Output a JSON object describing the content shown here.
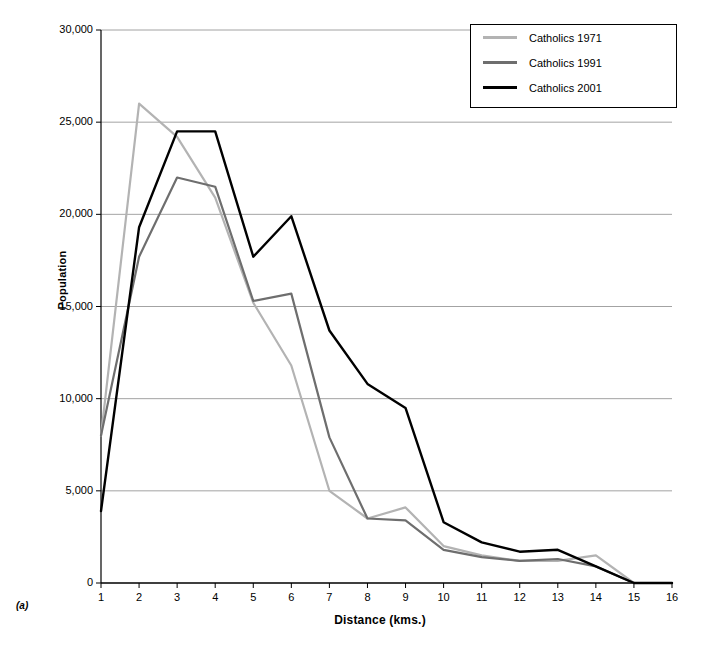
{
  "panel_label": "(a)",
  "legend": {
    "entries": [
      {
        "label": "Catholics 1971",
        "color": "#b3b3b3"
      },
      {
        "label": "Catholics 1991",
        "color": "#6e6e6e"
      },
      {
        "label": "Catholics 2001",
        "color": "#000000"
      }
    ]
  },
  "axes": {
    "y_ticks": [
      "0",
      "5,000",
      "10,000",
      "15,000",
      "20,000",
      "25,000",
      "30,000"
    ],
    "x_ticks": [
      "1",
      "2",
      "3",
      "4",
      "5",
      "6",
      "7",
      "8",
      "9",
      "10",
      "11",
      "12",
      "13",
      "14",
      "15",
      "16"
    ]
  },
  "chart_data": {
    "type": "line",
    "title": "",
    "xlabel": "Distance (kms.)",
    "ylabel": "Population",
    "xlim": [
      1,
      16
    ],
    "ylim": [
      0,
      30000
    ],
    "ytick_values": [
      0,
      5000,
      10000,
      15000,
      20000,
      25000,
      30000
    ],
    "grid": "horizontal",
    "legend_position": "top-right",
    "x": [
      1,
      2,
      3,
      4,
      5,
      6,
      7,
      8,
      9,
      10,
      11,
      12,
      13,
      14,
      15,
      16
    ],
    "series": [
      {
        "name": "Catholics 1971",
        "color": "#b3b3b3",
        "values": [
          8000,
          26000,
          24200,
          20900,
          15200,
          11800,
          5000,
          3500,
          4100,
          2000,
          1500,
          1200,
          1200,
          1500,
          0,
          0
        ]
      },
      {
        "name": "Catholics 1991",
        "color": "#6e6e6e",
        "values": [
          8000,
          17700,
          22000,
          21500,
          15300,
          15700,
          7900,
          3500,
          3400,
          1800,
          1400,
          1200,
          1300,
          900,
          0,
          0
        ]
      },
      {
        "name": "Catholics 2001",
        "color": "#000000",
        "values": [
          3900,
          19300,
          24500,
          24500,
          17700,
          19900,
          13700,
          10800,
          9500,
          3300,
          2200,
          1700,
          1800,
          900,
          0,
          0
        ]
      }
    ]
  }
}
